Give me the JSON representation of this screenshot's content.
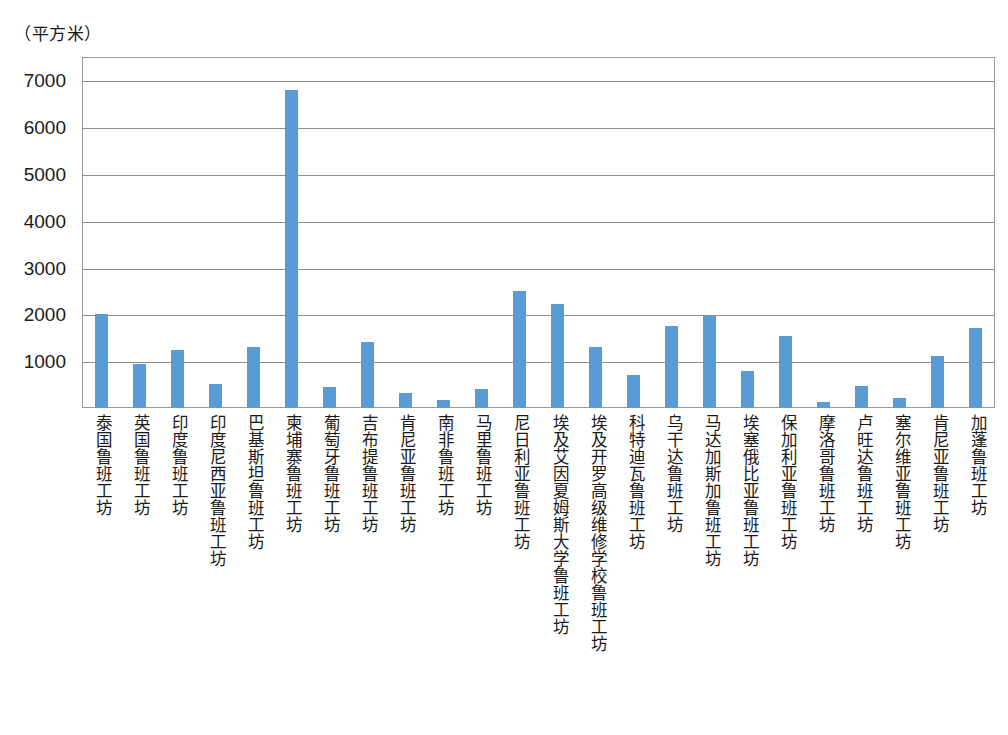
{
  "chart_data": {
    "type": "bar",
    "title": "",
    "subtitle": "",
    "unit_label": "（平方米）",
    "xlabel": "",
    "ylabel": "",
    "ylim": [
      0,
      7500
    ],
    "y_ticks": [
      1000,
      2000,
      3000,
      4000,
      5000,
      6000,
      7000
    ],
    "y_tick_labels": [
      "1000",
      "2000",
      "3000",
      "4000",
      "5000",
      "6000",
      "7000"
    ],
    "grid": true,
    "legend": "none",
    "bar_color": "#5b9bd5",
    "categories": [
      "泰国鲁班工坊",
      "英国鲁班工坊",
      "印度鲁班工坊",
      "印度尼西亚鲁班工坊",
      "巴基斯坦鲁班工坊",
      "柬埔寨鲁班工坊",
      "葡萄牙鲁班工坊",
      "吉布提鲁班工坊",
      "肯尼亚鲁班工坊",
      "南非鲁班工坊",
      "马里鲁班工坊",
      "尼日利亚鲁班工坊",
      "埃及艾因夏姆斯大学鲁班工坊",
      "埃及开罗高级维修学校鲁班工坊",
      "科特迪瓦鲁班工坊",
      "乌干达鲁班工坊",
      "马达加斯加鲁班工坊",
      "埃塞俄比亚鲁班工坊",
      "保加利亚鲁班工坊",
      "摩洛哥鲁班工坊",
      "卢旺达鲁班工坊",
      "塞尔维亚鲁班工坊",
      "肯尼亚鲁班工坊",
      "加蓬鲁班工坊"
    ],
    "values": [
      2000,
      930,
      1230,
      510,
      1300,
      6800,
      450,
      1420,
      330,
      170,
      400,
      2500,
      2230,
      1310,
      700,
      1760,
      1980,
      790,
      1540,
      130,
      470,
      210,
      1120,
      1720
    ]
  },
  "scan_artifact": ""
}
